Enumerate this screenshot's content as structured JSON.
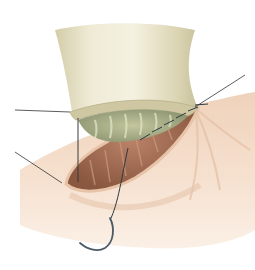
{
  "figure": {
    "type": "surgical-illustration",
    "labels": [],
    "leader_lines": [
      {
        "name": "leader-graft-rim",
        "from": [
          15,
          110
        ],
        "to": [
          70,
          112
        ]
      },
      {
        "name": "leader-tissue-edge",
        "from": [
          15,
          152
        ],
        "to": [
          62,
          183
        ]
      },
      {
        "name": "leader-suture-corner",
        "from": [
          245,
          75
        ],
        "to": [
          195,
          107
        ]
      }
    ],
    "elements": [
      "graft-cylinder",
      "graft-lumen",
      "tissue-surface",
      "tissue-opening",
      "running-suture",
      "curved-needle"
    ]
  },
  "colors": {
    "background": "#ffffff",
    "graft_light": "#f1eedb",
    "graft_mid": "#ddd7b8",
    "graft_shadow": "#c2bb97",
    "lumen": "#a9ae86",
    "lumen_dark": "#7d8660",
    "tissue_light": "#f7e3d2",
    "tissue_mid": "#ebcbb3",
    "tissue_shadow": "#d8ab8d",
    "opening": "#a5715a",
    "opening_dark": "#7d4d3a",
    "suture": "#2f3a40",
    "needle": "#4b5a66",
    "leader": "#333333"
  }
}
